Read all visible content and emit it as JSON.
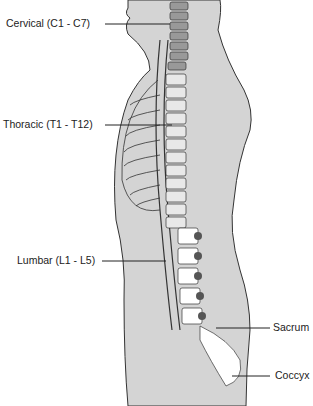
{
  "diagram": {
    "labels": [
      {
        "id": "cervical",
        "text": "Cervical (C1 - C7)"
      },
      {
        "id": "thoracic",
        "text": "Thoracic (T1 - T12)"
      },
      {
        "id": "lumbar",
        "text": "Lumbar (L1 - L5)"
      },
      {
        "id": "sacrum",
        "text": "Sacrum"
      },
      {
        "id": "coccyx",
        "text": "Coccyx"
      }
    ],
    "vertebra_numbers": {
      "cervical": [
        "1",
        "2",
        "3",
        "4",
        "5",
        "6",
        "7"
      ],
      "thoracic": [
        "1",
        "2",
        "3",
        "4",
        "5",
        "6",
        "7",
        "8",
        "9",
        "10",
        "11",
        "12"
      ],
      "lumbar": [
        "1",
        "2",
        "3",
        "4",
        "5"
      ]
    },
    "colors": {
      "body_fill": "#d4d4d4",
      "outline": "#333333",
      "bone": "#ffffff",
      "dark_bone": "#555555"
    }
  }
}
